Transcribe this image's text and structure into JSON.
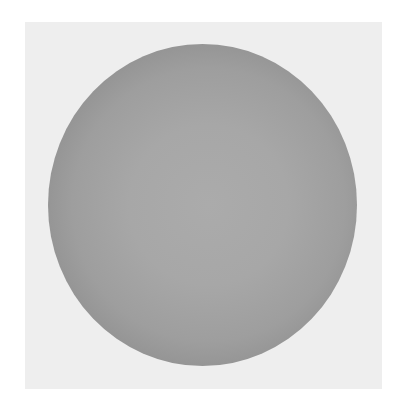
{
  "scene": {
    "description": "Grayscale shaded sphere on a light gray square backdrop",
    "background_color": "#ffffff",
    "backdrop": {
      "color": "#eeeeee",
      "x": 25,
      "y": 22,
      "width": 357,
      "height": 367
    },
    "sphere": {
      "center_color": "#ababab",
      "rim_color": "#727272",
      "x": 48,
      "y": 44,
      "width": 309,
      "height": 322
    }
  }
}
